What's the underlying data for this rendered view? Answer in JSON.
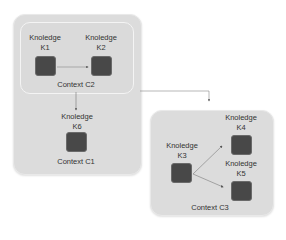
{
  "contexts": {
    "c1": {
      "label": "Context C1"
    },
    "c2": {
      "label": "Context C2"
    },
    "c3": {
      "label": "Context C3"
    }
  },
  "knowledge": {
    "k1": {
      "title": "Knoledge",
      "id": "K1"
    },
    "k2": {
      "title": "Knoledge",
      "id": "K2"
    },
    "k3": {
      "title": "Knoledge",
      "id": "K3"
    },
    "k4": {
      "title": "Knoledge",
      "id": "K4"
    },
    "k5": {
      "title": "Knoledge",
      "id": "K5"
    },
    "k6": {
      "title": "Knoledge",
      "id": "K6"
    }
  },
  "colors": {
    "context_fill": "#dcdcdc",
    "node_fill": "#484848",
    "edge": "#555555"
  }
}
